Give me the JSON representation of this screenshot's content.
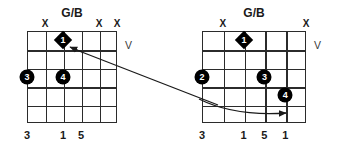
{
  "canvas": {
    "width": 344,
    "height": 153,
    "background": "#ffffff"
  },
  "ink_color": "#2b2b2b",
  "dot_color": "#000000",
  "diagrams": [
    {
      "id": "left",
      "title": "G/B",
      "position_marker": "V",
      "strings": 6,
      "frets": 5,
      "mutes": [
        {
          "string": 2,
          "label": "X"
        },
        {
          "string": 5,
          "label": "X"
        },
        {
          "string": 6,
          "label": "X"
        }
      ],
      "markers": [
        {
          "shape": "diamond",
          "label": "1",
          "string": 3,
          "fret": 1
        },
        {
          "shape": "circle",
          "label": "3",
          "string": 1,
          "fret": 3
        },
        {
          "shape": "circle",
          "label": "4",
          "string": 3,
          "fret": 3
        }
      ],
      "bottom_labels": [
        {
          "string": 1,
          "label": "3"
        },
        {
          "string": 3,
          "label": "1"
        },
        {
          "string": 4,
          "label": "5"
        }
      ]
    },
    {
      "id": "right",
      "title": "G/B",
      "position_marker": "V",
      "strings": 6,
      "frets": 5,
      "mutes": [
        {
          "string": 2,
          "label": "X"
        },
        {
          "string": 6,
          "label": "X"
        }
      ],
      "markers": [
        {
          "shape": "diamond",
          "label": "1",
          "string": 3,
          "fret": 1
        },
        {
          "shape": "circle",
          "label": "2",
          "string": 1,
          "fret": 3
        },
        {
          "shape": "circle",
          "label": "3",
          "string": 4,
          "fret": 3
        },
        {
          "shape": "circle",
          "label": "4",
          "string": 5,
          "fret": 4
        }
      ],
      "bottom_labels": [
        {
          "string": 1,
          "label": "3"
        },
        {
          "string": 3,
          "label": "1"
        },
        {
          "string": 4,
          "label": "5"
        },
        {
          "string": 5,
          "label": "1"
        }
      ]
    }
  ],
  "connector": {
    "type": "arrow",
    "description": "voice-leading arrow from left diagram fret 1 to right diagram fret 4 dot",
    "from": {
      "x": 78,
      "y": 51
    },
    "to": {
      "x": 291,
      "y": 112
    }
  }
}
